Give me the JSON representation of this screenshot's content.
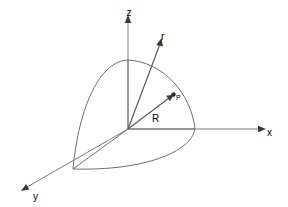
{
  "figure": {
    "type": "3d-coordinate-diagram",
    "background_color": "#ffffff",
    "line_color": "#6e6e6e",
    "label_color": "#1c1c1c",
    "width": 288,
    "height": 207
  },
  "axes": [
    {
      "id": "z",
      "label": "z",
      "label_x": 127,
      "label_y": 11,
      "from_x": 128,
      "from_y": 129,
      "to_x": 128,
      "to_y": 18,
      "arrow_angle_deg": -90
    },
    {
      "id": "x",
      "label": "x",
      "label_x": 273,
      "label_y": 131,
      "from_x": 128,
      "from_y": 129,
      "to_x": 264,
      "to_y": 129,
      "arrow_angle_deg": 0
    },
    {
      "id": "y",
      "label": "y",
      "label_x": 39,
      "label_y": 196,
      "from_x": 128,
      "from_y": 129,
      "to_x": 24,
      "to_y": 189,
      "arrow_angle_deg": 150
    }
  ],
  "origin": {
    "label": "O",
    "x": 128,
    "y": 129
  },
  "vectors": [
    {
      "id": "r",
      "label": "r",
      "label_x": 165,
      "label_y": 34,
      "from_x": 128,
      "from_y": 129,
      "to_x": 161,
      "to_y": 40,
      "has_arrow": true
    },
    {
      "id": "R",
      "label": "R",
      "label_x": 157,
      "label_y": 118,
      "from_x": 128,
      "from_y": 129,
      "to_x": 172,
      "to_y": 96,
      "has_arrow": true
    }
  ],
  "points": [
    {
      "id": "P",
      "label": "P",
      "x": 173,
      "y": 95,
      "label_x": 178,
      "label_y": 93,
      "radius": 2.2
    }
  ],
  "surface": {
    "description": "quarter-sphere octant surface",
    "sphere_center_x": 128,
    "sphere_center_y": 129,
    "radius_z_top_x": 128,
    "radius_z_top_y": 60,
    "radius_x_end_x": 195,
    "radius_x_end_y": 129,
    "radius_y_end_x": 73,
    "radius_y_end_y": 169
  }
}
